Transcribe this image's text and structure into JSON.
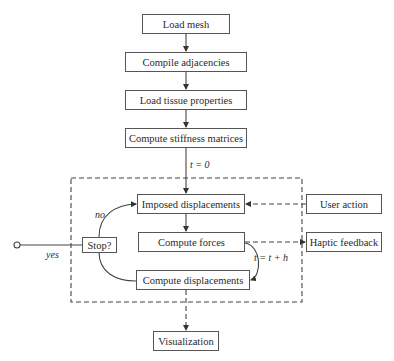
{
  "diagram": {
    "setup_steps": [
      {
        "id": "load-mesh",
        "label": "Load mesh"
      },
      {
        "id": "compile-adjacencies",
        "label": "Compile adjacencies"
      },
      {
        "id": "load-tissue-properties",
        "label": "Load tissue properties"
      },
      {
        "id": "compute-stiffness-matrices",
        "label": "Compute stiffness matrices"
      }
    ],
    "loop": {
      "entry_label": "t = 0",
      "steps": [
        {
          "id": "imposed-displacements",
          "label": "Imposed displacements"
        },
        {
          "id": "compute-forces",
          "label": "Compute forces"
        },
        {
          "id": "compute-displacements",
          "label": "Compute displacements"
        }
      ],
      "decision": {
        "label": "Stop?",
        "no_label": "no",
        "yes_label": "yes"
      },
      "increment_label": "t = t + h"
    },
    "external": {
      "user_action": "User action",
      "haptic_feedback": "Haptic feedback",
      "visualization": "Visualization"
    },
    "colors": {
      "line": "#444444",
      "box_border": "#555555",
      "text": "#2a2a2a"
    }
  }
}
